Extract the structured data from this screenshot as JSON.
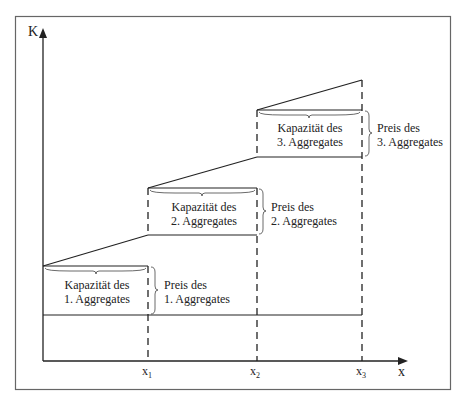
{
  "diagram": {
    "axes": {
      "y_label": "K",
      "x_label": "x",
      "x_ticks": [
        {
          "label": "x",
          "sub": "1"
        },
        {
          "label": "x",
          "sub": "2"
        },
        {
          "label": "x",
          "sub": "3"
        }
      ]
    },
    "blocks": [
      {
        "capacity_line1": "Kapazität des",
        "capacity_line2": "1. Aggregates",
        "price_line1": "Preis des",
        "price_line2": "1. Aggregates"
      },
      {
        "capacity_line1": "Kapazität des",
        "capacity_line2": "2. Aggregates",
        "price_line1": "Preis des",
        "price_line2": "2. Aggregates"
      },
      {
        "capacity_line1": "Kapazität des",
        "capacity_line2": "3. Aggregates",
        "price_line1": "Preis des",
        "price_line2": "3. Aggregates"
      }
    ],
    "colors": {
      "line": "#222222",
      "frame": "#555555",
      "background": "#ffffff"
    }
  }
}
